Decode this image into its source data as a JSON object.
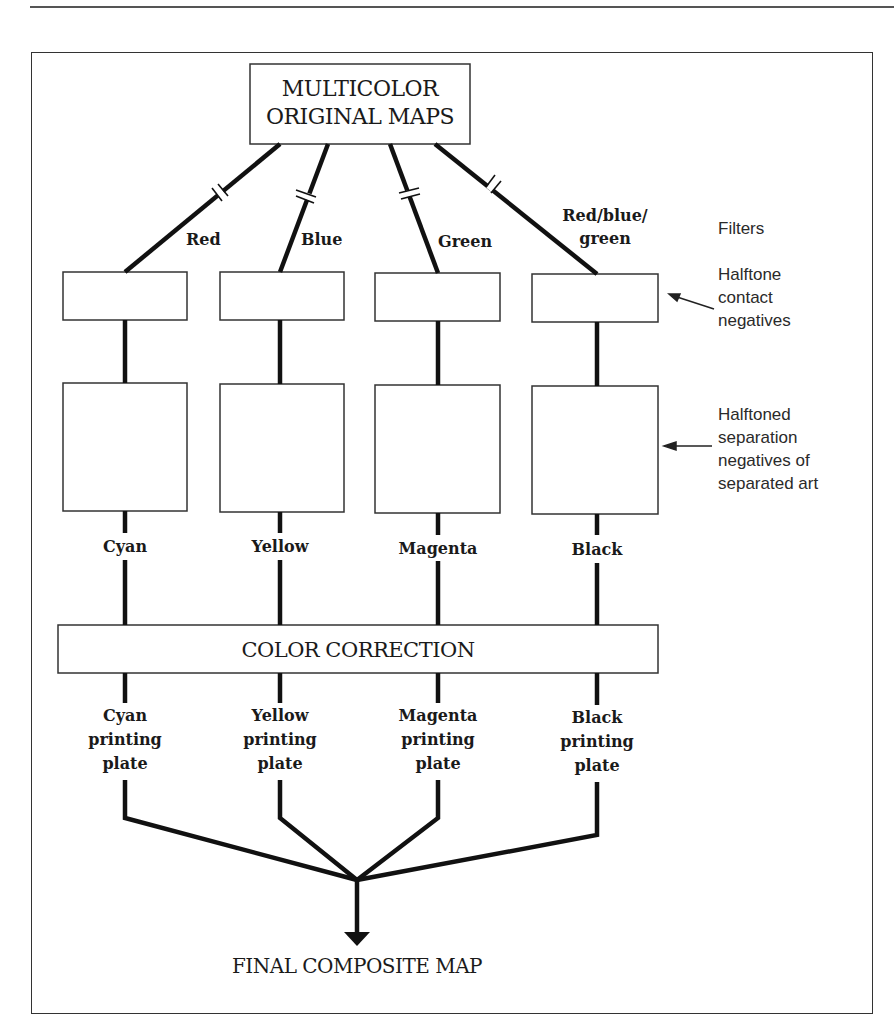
{
  "diagram": {
    "top_box": {
      "line1": "MULTICOLOR",
      "line2": "ORIGINAL MAPS"
    },
    "filters": [
      {
        "label": "Red"
      },
      {
        "label": "Blue"
      },
      {
        "label": "Green"
      },
      {
        "label_line1": "Red/blue/",
        "label_line2": "green"
      }
    ],
    "separations": [
      {
        "name": "Cyan"
      },
      {
        "name": "Yellow"
      },
      {
        "name": "Magenta"
      },
      {
        "name": "Black"
      }
    ],
    "correction_box": {
      "label": "COLOR CORRECTION"
    },
    "plates": [
      {
        "line1": "Cyan",
        "line2": "printing",
        "line3": "plate"
      },
      {
        "line1": "Yellow",
        "line2": "printing",
        "line3": "plate"
      },
      {
        "line1": "Magenta",
        "line2": "printing",
        "line3": "plate"
      },
      {
        "line1": "Black",
        "line2": "printing",
        "line3": "plate"
      }
    ],
    "final": {
      "label": "FINAL COMPOSITE MAP"
    },
    "annotations": {
      "filters": "Filters",
      "halftone_contact": {
        "line1": "Halftone",
        "line2": "contact",
        "line3": "negatives"
      },
      "halftoned_separation": {
        "line1": "Halftoned",
        "line2": "separation",
        "line3": "negatives of",
        "line4": "separated art"
      }
    }
  }
}
